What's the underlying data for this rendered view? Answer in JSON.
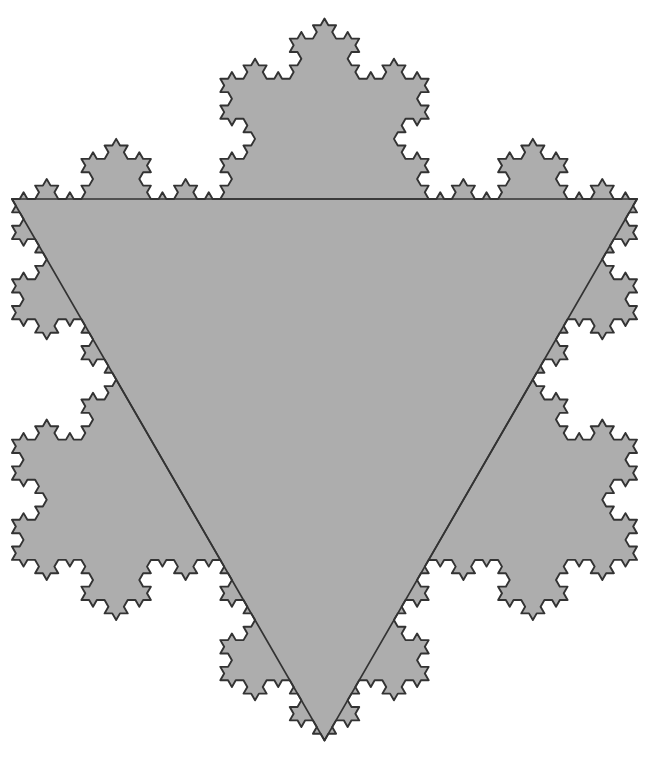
{
  "figure": {
    "name": "Koch snowflake",
    "alt_names": [
      "von Koch curve",
      "Koch star",
      "snowflake fractal"
    ],
    "background_color": "#ffffff",
    "fill_color": "#adadad",
    "stroke_color": "#333333",
    "stroke_width": 1.9,
    "construction_stroke_width": 1.7,
    "width": 657,
    "height": 761
  },
  "chart_data": {
    "type": "diagram",
    "subtype": "koch-snowflake",
    "title": "",
    "iterations": 4,
    "initiator": "equilateral triangle (apex pointing down)",
    "generator": "replace each segment with 4 segments, middle third replaced by two sides of an outward equilateral triangle",
    "base_triangle": {
      "description": "Initiator equilateral triangle, flat side on top, apex pointing down",
      "vertices": [
        {
          "label": "top-left",
          "x": 12,
          "y": 199
        },
        {
          "label": "top-right",
          "x": 637,
          "y": 199
        },
        {
          "label": "bottom-apex",
          "x": 324.5,
          "y": 740.4
        }
      ],
      "side_length": 625
    },
    "outward_spikes": {
      "count_level_1": 3,
      "level_1_apex_points": [
        {
          "label": "top-spike",
          "x": 324.5,
          "y": 18.7
        },
        {
          "label": "lower-left-spike",
          "x": 63.9,
          "y": 559.8
        },
        {
          "label": "lower-right-spike",
          "x": 585.1,
          "y": 559.8
        }
      ]
    },
    "visible_construction_lines": [
      "base initiator triangle outline (flat top edge, two slanted sides meeting at bottom apex)",
      "chords at the base of each level-1 outward spike forming the Star of David hexagram"
    ],
    "symmetry": "6-fold dihedral (D6) about the figure centroid",
    "centroid": {
      "x": 324.5,
      "y": 379.5
    },
    "fractal_dimension": 1.2619
  }
}
